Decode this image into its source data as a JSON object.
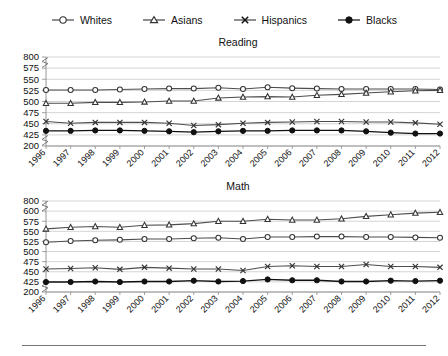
{
  "legend": {
    "items": [
      {
        "label": "Whites",
        "marker": "open-circle-marker",
        "icon": "circle-open-icon"
      },
      {
        "label": "Asians",
        "marker": "open-triangle-marker",
        "icon": "triangle-open-icon"
      },
      {
        "label": "Hispanics",
        "marker": "x-marker",
        "icon": "x-cross-icon"
      },
      {
        "label": "Blacks",
        "marker": "filled-circle-marker",
        "icon": "circle-filled-icon"
      }
    ]
  },
  "colors": {
    "line": "#4d4d4d",
    "line_black": "#111111",
    "grid": "#c9c9c9",
    "axis": "#8a8a8a",
    "text": "#111111",
    "background": "#ffffff"
  },
  "chart_data": [
    {
      "type": "line",
      "title": "Reading",
      "xlabel": "",
      "ylabel": "",
      "grid": true,
      "legend_position": "top-center",
      "axis_break": true,
      "ylim": [
        200,
        800
      ],
      "yticks": [
        200,
        425,
        450,
        475,
        500,
        525,
        550,
        575,
        800
      ],
      "ytick_labels": [
        "200",
        "425",
        "450",
        "475",
        "500",
        "525",
        "550",
        "575",
        "800"
      ],
      "categories": [
        "1996",
        "1997",
        "1998",
        "1999",
        "2000",
        "2001",
        "2002",
        "2003",
        "2004",
        "2005",
        "2006",
        "2007",
        "2008",
        "2009",
        "2010",
        "2011",
        "2012"
      ],
      "series": [
        {
          "name": "Whites",
          "values": [
            526,
            526,
            526,
            527,
            528,
            529,
            529,
            531,
            528,
            532,
            530,
            529,
            528,
            528,
            528,
            528,
            527
          ]
        },
        {
          "name": "Asians",
          "values": [
            496,
            496,
            498,
            498,
            499,
            501,
            501,
            508,
            510,
            511,
            510,
            514,
            516,
            519,
            522,
            524,
            525
          ]
        },
        {
          "name": "Hispanics",
          "values": [
            455,
            451,
            453,
            453,
            453,
            451,
            446,
            448,
            451,
            453,
            454,
            455,
            455,
            454,
            454,
            452,
            449
          ]
        },
        {
          "name": "Blacks",
          "values": [
            434,
            434,
            435,
            435,
            434,
            433,
            431,
            433,
            434,
            434,
            435,
            435,
            435,
            433,
            430,
            428,
            428
          ]
        }
      ]
    },
    {
      "type": "line",
      "title": "Math",
      "xlabel": "",
      "ylabel": "",
      "grid": true,
      "legend_position": "top-center",
      "axis_break": true,
      "ylim": [
        200,
        800
      ],
      "yticks": [
        200,
        425,
        450,
        475,
        500,
        525,
        550,
        575,
        600,
        800
      ],
      "ytick_labels": [
        "200",
        "425",
        "450",
        "475",
        "500",
        "525",
        "550",
        "575",
        "600",
        "800"
      ],
      "categories": [
        "1996",
        "1997",
        "1998",
        "1999",
        "2000",
        "2001",
        "2002",
        "2003",
        "2004",
        "2005",
        "2006",
        "2007",
        "2008",
        "2009",
        "2010",
        "2011",
        "2012"
      ],
      "series": [
        {
          "name": "Asians",
          "values": [
            556,
            560,
            562,
            560,
            565,
            566,
            569,
            575,
            575,
            580,
            578,
            578,
            581,
            587,
            591,
            595,
            597
          ]
        },
        {
          "name": "Whites",
          "values": [
            523,
            526,
            528,
            529,
            531,
            531,
            533,
            534,
            531,
            536,
            536,
            537,
            537,
            536,
            536,
            535,
            534
          ]
        },
        {
          "name": "Hispanics",
          "values": [
            457,
            458,
            460,
            456,
            461,
            459,
            457,
            457,
            453,
            463,
            465,
            463,
            463,
            468,
            463,
            463,
            461
          ]
        },
        {
          "name": "Blacks",
          "values": [
            422,
            423,
            426,
            422,
            426,
            426,
            428,
            426,
            427,
            431,
            429,
            429,
            426,
            426,
            428,
            427,
            428
          ]
        }
      ]
    }
  ]
}
